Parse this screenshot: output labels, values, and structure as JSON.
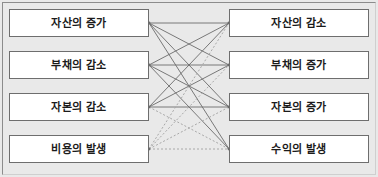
{
  "diagram": {
    "background_color": "#e9e9e9",
    "box_fill_color": "#ffffff",
    "box_border_color": "#6e6e6e",
    "solid_link_color": "#6b6b6b",
    "dotted_link_color": "#a8a8a8",
    "left_column": [
      {
        "id": "asset-increase",
        "label": "자산의 증가"
      },
      {
        "id": "liability-decrease",
        "label": "부채의 감소"
      },
      {
        "id": "capital-decrease",
        "label": "자본의 감소"
      },
      {
        "id": "expense-occur",
        "label": "비용의 발생"
      }
    ],
    "right_column": [
      {
        "id": "asset-decrease",
        "label": "자산의 감소"
      },
      {
        "id": "liability-increase",
        "label": "부채의 증가"
      },
      {
        "id": "capital-increase",
        "label": "자본의 증가"
      },
      {
        "id": "revenue-occur",
        "label": "수익의 발생"
      }
    ],
    "links": [
      {
        "from": 0,
        "to": 0,
        "style": "solid"
      },
      {
        "from": 0,
        "to": 1,
        "style": "solid"
      },
      {
        "from": 0,
        "to": 2,
        "style": "solid"
      },
      {
        "from": 0,
        "to": 3,
        "style": "solid"
      },
      {
        "from": 1,
        "to": 0,
        "style": "solid"
      },
      {
        "from": 1,
        "to": 1,
        "style": "solid"
      },
      {
        "from": 1,
        "to": 2,
        "style": "solid"
      },
      {
        "from": 1,
        "to": 3,
        "style": "solid"
      },
      {
        "from": 2,
        "to": 0,
        "style": "solid"
      },
      {
        "from": 2,
        "to": 1,
        "style": "solid"
      },
      {
        "from": 2,
        "to": 2,
        "style": "solid"
      },
      {
        "from": 2,
        "to": 3,
        "style": "dotted"
      },
      {
        "from": 3,
        "to": 0,
        "style": "dotted"
      },
      {
        "from": 3,
        "to": 1,
        "style": "dotted"
      },
      {
        "from": 3,
        "to": 2,
        "style": "dotted"
      },
      {
        "from": 3,
        "to": 3,
        "style": "dotted"
      }
    ]
  }
}
